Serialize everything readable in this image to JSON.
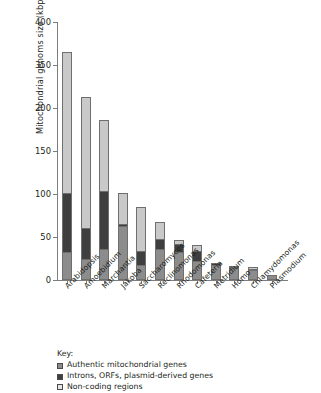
{
  "chart_data": {
    "type": "bar",
    "title": "",
    "xlabel": "",
    "ylabel": "Mitochondrial genoms size (kbp)",
    "stacked": true,
    "grid": false,
    "legend_position": "bottom-left",
    "y_tick_labels": [
      "400",
      "350",
      "200",
      "150",
      "100",
      "50",
      "0"
    ],
    "y_tick_values": [
      400,
      350,
      200,
      150,
      100,
      50,
      0
    ],
    "note_axis": "tick labels are printed at evenly spaced positions as shown",
    "categories": [
      "Arabidopsis",
      "Amoebidium",
      "Marchantia",
      "Jakoba",
      "Saccharomyces",
      "Reclinomonas",
      "Rhodomonas",
      "Cafeteria",
      "Metridium",
      "Homo",
      "Chlamydomonas",
      "Plasmodium"
    ],
    "series": [
      {
        "name": "Authentic mitochondrial genes",
        "color": "#8c8c8c",
        "values": [
          33,
          25,
          36,
          63,
          18,
          36,
          33,
          22,
          17,
          14,
          12,
          6
        ]
      },
      {
        "name": "Introns, ORFs, plasmid-derived genes",
        "color": "#3f3f3f",
        "values": [
          69,
          36,
          68,
          3,
          17,
          12,
          10,
          12,
          3,
          2,
          2,
          0
        ]
      },
      {
        "name": "Non-coding regions",
        "color": "#c9c9c9",
        "values": [
          265,
          180,
          83,
          36,
          51,
          21,
          5,
          8,
          0,
          2,
          3,
          0
        ]
      }
    ],
    "bar_totals": [
      367,
      241,
      187,
      102,
      86,
      69,
      48,
      42,
      20,
      18,
      17,
      6
    ]
  },
  "legend": {
    "title": "Key:",
    "items": [
      {
        "label": "Authentic mitochondrial genes",
        "color": "#8c8c8c"
      },
      {
        "label": "Introns, ORFs, plasmid-derived genes",
        "color": "#3f3f3f"
      },
      {
        "label": "Non-coding regions",
        "color": "#e6e6e6"
      }
    ]
  },
  "colors": {
    "authentic": "#8c8c8c",
    "introns": "#3f3f3f",
    "noncoding": "#c9c9c9",
    "axis": "#7d7d7d",
    "text": "#231f20",
    "background": "#ffffff"
  }
}
